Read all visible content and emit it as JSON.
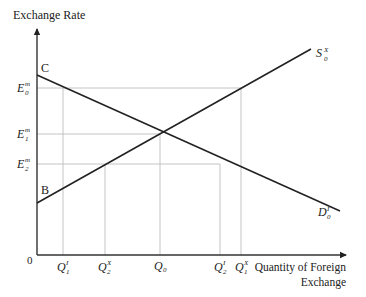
{
  "diagram": {
    "y_axis_label": "Exchange Rate",
    "x_axis_label_line1": "Quantity of Foreign",
    "x_axis_label_line2": "Exchange",
    "origin_label": "0",
    "points": {
      "C": "C",
      "B": "B"
    },
    "curves": {
      "supply": {
        "base": "S",
        "sup": "X",
        "sub": "0"
      },
      "demand": {
        "base": "D",
        "sup": "I",
        "sub": "0"
      }
    },
    "y_ticks": [
      {
        "id": "E0",
        "base": "E",
        "sup": "m",
        "sub": "0"
      },
      {
        "id": "E1",
        "base": "E",
        "sup": "m",
        "sub": "1"
      },
      {
        "id": "E2",
        "base": "E",
        "sup": "m",
        "sub": "2"
      }
    ],
    "x_ticks": [
      {
        "id": "Q1I",
        "base": "Q",
        "sup": "I",
        "sub": "1"
      },
      {
        "id": "Q2X",
        "base": "Q",
        "sup": "X",
        "sub": "2"
      },
      {
        "id": "Q0",
        "base": "Q",
        "sup": "",
        "sub": "0"
      },
      {
        "id": "Q2I",
        "base": "Q",
        "sup": "I",
        "sub": "2"
      },
      {
        "id": "Q1X",
        "base": "Q",
        "sup": "X",
        "sub": "1"
      }
    ]
  }
}
